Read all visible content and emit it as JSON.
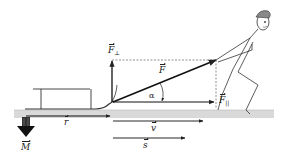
{
  "diagram": {
    "colors": {
      "ground": "#d9d9d9",
      "ink": "#222222",
      "background": "#ffffff"
    },
    "labels": {
      "force": "F",
      "force_perpendicular": "F",
      "force_perpendicular_sub": "⊥",
      "force_parallel": "F",
      "force_parallel_sub": "||",
      "friction": "r",
      "velocity": "v",
      "displacement": "s",
      "weight": "M",
      "angle": "α"
    },
    "vectors": [
      {
        "name": "F",
        "description": "rope force, diagonal from sled hitch to hands"
      },
      {
        "name": "F_perpendicular",
        "description": "vertical component, upward"
      },
      {
        "name": "F_parallel",
        "description": "horizontal component, rightward"
      },
      {
        "name": "r",
        "description": "along ground, rightward under sled"
      },
      {
        "name": "v",
        "description": "velocity, rightward"
      },
      {
        "name": "s",
        "description": "displacement, rightward"
      },
      {
        "name": "M",
        "description": "weight-like downward arrow at left"
      }
    ]
  }
}
